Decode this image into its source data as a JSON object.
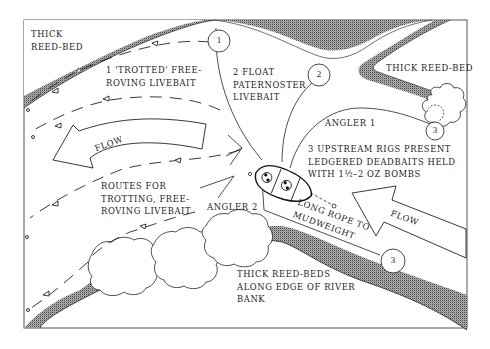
{
  "diagram": {
    "title": "",
    "labels": {
      "reed_bed_topleft": [
        "THICK",
        "REED-BED"
      ],
      "reed_bed_right": "THICK REED-BED",
      "reed_beds_bottom": [
        "THICK  REED-BEDS",
        "ALONG EDGE OF RIVER",
        "BANK"
      ],
      "rig1": [
        "1  'TROTTED'  FREE-",
        "ROVING LIVEBAIT"
      ],
      "rig2": [
        "2  FLOAT",
        "PATERNOSTER",
        "LIVEBAIT"
      ],
      "rig3": [
        "3  UPSTREAM RIGS PRESENT",
        "LEDGERED DEADBAITS HELD",
        "WITH 1½–2 OZ BOMBS"
      ],
      "routes": [
        "ROUTES FOR",
        "TROTTING, FREE-",
        "ROVING LIVEBAIT"
      ],
      "angler1": "ANGLER 1",
      "angler2": "ANGLER 2",
      "rope": [
        "LONG ROPE TO",
        "MUDWEIGHT"
      ],
      "flow_left": "FLOW",
      "flow_right": "FLOW"
    },
    "markers": [
      {
        "id": "marker-1",
        "label": "1"
      },
      {
        "id": "marker-2",
        "label": "2"
      },
      {
        "id": "marker-3-bottom",
        "label": "3"
      },
      {
        "id": "marker-3-right",
        "label": "3"
      }
    ],
    "colors": {
      "ink": "#1c1c1c",
      "background": "#ffffff",
      "stipple": "#555555"
    }
  }
}
